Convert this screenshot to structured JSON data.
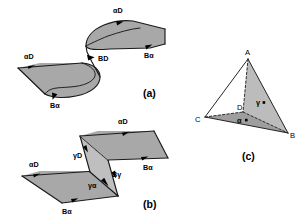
{
  "figure": {
    "background_color": "#ffffff",
    "ink_color": "#000000",
    "surface_fill": "#a8a8a8",
    "surface_fill_light": "#bfbfbf",
    "panels": [
      {
        "id": "a",
        "caption": "(a)",
        "description": "Two curved glide surfaces connected by a step segment",
        "labels": [
          {
            "name": "lower-leading-edge",
            "text": "αD"
          },
          {
            "name": "lower-trailing-edge",
            "text": "Bα"
          },
          {
            "name": "step-segment",
            "text": "BD"
          },
          {
            "name": "upper-leading-edge",
            "text": "αD"
          },
          {
            "name": "upper-trailing-edge",
            "text": "Bα"
          }
        ]
      },
      {
        "id": "b",
        "caption": "(b)",
        "description": "Two planar glide surfaces joined by a faulted parallelogram ribbon",
        "labels": [
          {
            "name": "lower-leading-edge",
            "text": "αD"
          },
          {
            "name": "lower-trailing-edge",
            "text": "Bα"
          },
          {
            "name": "ribbon-left-edge",
            "text": "γD"
          },
          {
            "name": "ribbon-upper-edge",
            "text": "γα"
          },
          {
            "name": "ribbon-lower-edge",
            "text": "γα"
          },
          {
            "name": "ribbon-right-edge",
            "text": "Bγ"
          },
          {
            "name": "upper-leading-edge",
            "text": "αD"
          },
          {
            "name": "upper-trailing-edge",
            "text": "Bα"
          }
        ]
      },
      {
        "id": "c",
        "caption": "(c)",
        "description": "Thompson tetrahedron with vertices A, B, C, D and face poles",
        "vertices": [
          {
            "name": "vertex-a",
            "text": "A"
          },
          {
            "name": "vertex-b",
            "text": "B"
          },
          {
            "name": "vertex-c",
            "text": "C"
          },
          {
            "name": "vertex-d",
            "text": "D"
          }
        ],
        "face_poles": [
          {
            "name": "pole-gamma",
            "text": "γ"
          },
          {
            "name": "pole-alpha",
            "text": "α"
          }
        ]
      }
    ]
  }
}
